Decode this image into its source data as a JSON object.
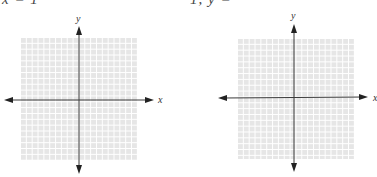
{
  "header": {
    "left_fragment": "x = 1",
    "right_fragment": "1, y ="
  },
  "graphs": [
    {
      "id": "left",
      "x_label": "x",
      "y_label": "y",
      "grid_cells": 20
    },
    {
      "id": "right",
      "x_label": "x",
      "y_label": "y",
      "grid_cells": 20
    }
  ],
  "colors": {
    "grid_fill": "#e6e6e6",
    "grid_lines": "#ffffff",
    "axis": "#3a3a3a"
  }
}
